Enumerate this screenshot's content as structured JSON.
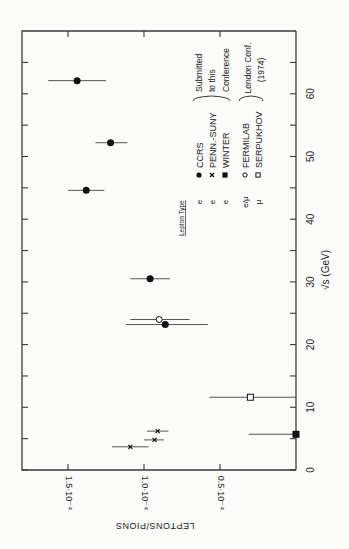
{
  "chart_data": {
    "type": "scatter",
    "orientation": "rotated-90-clockwise",
    "title": "",
    "xlabel": "√s (GeV)",
    "ylabel": "LEPTONS/PIONS",
    "xlim": [
      0,
      70
    ],
    "ylim": [
      0,
      0.00018
    ],
    "x_ticks": [
      0,
      10,
      20,
      30,
      40,
      50,
      60
    ],
    "x_minor_ticks": [
      5,
      15,
      25,
      35,
      45,
      55,
      65
    ],
    "x_tick_labels": [
      "0",
      "10",
      "20",
      "30",
      "40",
      "50",
      "60"
    ],
    "y_ticks": [
      5e-05,
      0.0001,
      0.00015
    ],
    "y_tick_labels": [
      "0.5·10⁻⁴",
      "1.0·10⁻⁴",
      "1.5·10⁻⁴"
    ],
    "grid": false,
    "legend": {
      "header": "Lepton Type",
      "entries": [
        {
          "lepton": "e",
          "marker": "filled-circle",
          "label": "CCRS",
          "group": "Submitted to this Conference"
        },
        {
          "lepton": "e",
          "marker": "cross",
          "label": "PENN.-SUNY",
          "group": "Submitted to this Conference"
        },
        {
          "lepton": "e",
          "marker": "filled-square",
          "label": "WINTER",
          "group": "Submitted to this Conference"
        },
        {
          "lepton": "e/μ",
          "marker": "open-circle",
          "label": "FERMILAB",
          "group": "London Conf. (1974)"
        },
        {
          "lepton": "μ",
          "marker": "open-square",
          "label": "SERPUKHOV",
          "group": "London Conf. (1974)"
        }
      ],
      "groups": [
        {
          "lines": [
            "Submitted",
            "to this",
            "Conference"
          ]
        },
        {
          "lines": [
            "London Conf.",
            "(1974)"
          ]
        }
      ]
    },
    "series": [
      {
        "name": "CCRS",
        "marker": "filled-circle",
        "points": [
          {
            "x": 23.2,
            "y": 8.6e-05,
            "ylo": 5.8e-05,
            "yhi": 0.000112
          },
          {
            "x": 30.5,
            "y": 9.6e-05,
            "ylo": 8.3e-05,
            "yhi": 0.000109
          },
          {
            "x": 44.6,
            "y": 0.000138,
            "ylo": 0.000126,
            "yhi": 0.00015
          },
          {
            "x": 52.2,
            "y": 0.000122,
            "ylo": 0.000111,
            "yhi": 0.000132
          },
          {
            "x": 62.1,
            "y": 0.000144,
            "ylo": 0.000125,
            "yhi": 0.000163
          }
        ]
      },
      {
        "name": "PENN.-SUNY",
        "marker": "cross",
        "points": [
          {
            "x": 3.7,
            "y": 0.000109,
            "ylo": 9.7e-05,
            "yhi": 0.000121
          },
          {
            "x": 4.8,
            "y": 9.3e-05,
            "ylo": 8.7e-05,
            "yhi": 0.0001
          },
          {
            "x": 6.2,
            "y": 9.1e-05,
            "ylo": 8.4e-05,
            "yhi": 9.8e-05
          }
        ]
      },
      {
        "name": "WINTER",
        "marker": "filled-square",
        "points": [
          {
            "x": 5.7,
            "y": 0.0,
            "ylo": 0.0,
            "yhi": 3.1e-05
          }
        ]
      },
      {
        "name": "FERMILAB",
        "marker": "open-circle",
        "points": [
          {
            "x": 24.0,
            "y": 9e-05,
            "ylo": 7e-05,
            "yhi": 0.000109
          }
        ]
      },
      {
        "name": "SERPUKHOV",
        "marker": "open-square",
        "points": [
          {
            "x": 11.6,
            "y": 3e-05,
            "ylo": 0.0,
            "yhi": 5.7e-05
          }
        ]
      }
    ]
  }
}
